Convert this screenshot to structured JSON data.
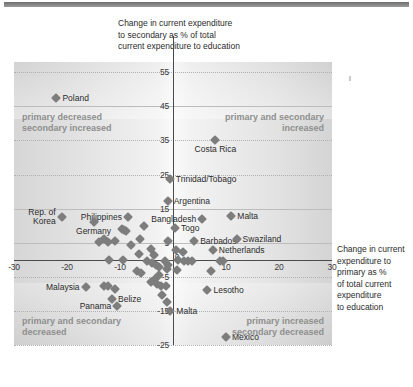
{
  "axis_titles": {
    "y": "Change in current expenditure\nto secondary as % of total\ncurrent expenditure to education",
    "x": "Change in current\nexpenditure to\nprimary as %\nof total current\nexpenditure\nto education"
  },
  "quadrants": {
    "top_left": "primary decreased\nsecondary increased",
    "top_right": "primary and secondary\nincreased",
    "bottom_left": "primary and secondary\ndecreased",
    "bottom_right": "primary increased\nsecondary decreased"
  },
  "chart_data": {
    "type": "scatter",
    "title": "",
    "xlabel": "Change in current expenditure to primary as % of total current expenditure to education",
    "ylabel": "Change in current expenditure to secondary as % of total current expenditure to education",
    "xlim": [
      -30,
      30
    ],
    "ylim": [
      -25,
      58
    ],
    "xticks": [
      -30,
      -20,
      -10,
      0,
      10,
      20,
      30
    ],
    "yticks": [
      55,
      45,
      35,
      25,
      15,
      5,
      -5,
      -15,
      -25
    ],
    "grid": true,
    "legend": "none",
    "marker": "diamond",
    "marker_color": "#7d7d7d",
    "points": [
      {
        "label": "Poland",
        "x": -22.0,
        "y": 47.5,
        "anchor": "right"
      },
      {
        "label": "Costa Rica",
        "x": 8.0,
        "y": 35.0,
        "anchor": "below"
      },
      {
        "label": "Trinidad/Tobago",
        "x": -0.6,
        "y": 23.8,
        "anchor": "right"
      },
      {
        "label": "Argentina",
        "x": -1.0,
        "y": 17.2,
        "anchor": "right"
      },
      {
        "label": "Rep. of\nKorea",
        "x": -21.0,
        "y": 12.6,
        "anchor": "left"
      },
      {
        "label": "Philippines",
        "x": -8.5,
        "y": 12.6,
        "anchor": "left"
      },
      {
        "label": "Bangladesh",
        "x": 5.5,
        "y": 12.0,
        "anchor": "left"
      },
      {
        "label": "Malta",
        "x": 11.0,
        "y": 12.8,
        "anchor": "right"
      },
      {
        "label": "Germany",
        "x": -15.0,
        "y": 11.0,
        "anchor": "below"
      },
      {
        "label": "Togo",
        "x": 0.4,
        "y": 9.2,
        "anchor": "right"
      },
      {
        "label": "Barbados",
        "x": 4.0,
        "y": 5.6,
        "anchor": "right"
      },
      {
        "label": "Swaziland",
        "x": 12.0,
        "y": 6.0,
        "anchor": "right"
      },
      {
        "label": "Netherlands",
        "x": 7.5,
        "y": 3.0,
        "anchor": "right"
      },
      {
        "label": "Malaysia",
        "x": -16.5,
        "y": -8.0,
        "anchor": "left"
      },
      {
        "label": "Belize",
        "x": -11.5,
        "y": -11.6,
        "anchor": "right"
      },
      {
        "label": "Panama",
        "x": -10.5,
        "y": -13.6,
        "anchor": "left"
      },
      {
        "label": "Malta",
        "x": -0.5,
        "y": -15.0,
        "anchor": "right"
      },
      {
        "label": "Lesotho",
        "x": 6.5,
        "y": -8.8,
        "anchor": "right"
      },
      {
        "label": "Mexico",
        "x": 10.0,
        "y": -22.6,
        "anchor": "right"
      },
      {
        "label": "",
        "x": -9.7,
        "y": 9.0
      },
      {
        "label": "",
        "x": -9.2,
        "y": 8.7
      },
      {
        "label": "",
        "x": -8.8,
        "y": 8.5
      },
      {
        "label": "",
        "x": -5.5,
        "y": 10.0
      },
      {
        "label": "",
        "x": -6.3,
        "y": 6.0
      },
      {
        "label": "",
        "x": -8.0,
        "y": 4.2
      },
      {
        "label": "",
        "x": -4.2,
        "y": 3.2
      },
      {
        "label": "",
        "x": -6.5,
        "y": 1.8
      },
      {
        "label": "",
        "x": -3.6,
        "y": 1.5
      },
      {
        "label": "",
        "x": -12.0,
        "y": 0.0
      },
      {
        "label": "",
        "x": -9.5,
        "y": 0.0
      },
      {
        "label": "",
        "x": -5.0,
        "y": -0.4
      },
      {
        "label": "",
        "x": -4.0,
        "y": -1.0
      },
      {
        "label": "",
        "x": -3.2,
        "y": -1.6
      },
      {
        "label": "",
        "x": -2.6,
        "y": -2.2
      },
      {
        "label": "",
        "x": -1.6,
        "y": -0.4
      },
      {
        "label": "",
        "x": -1.0,
        "y": -1.4
      },
      {
        "label": "",
        "x": -1.2,
        "y": -2.6
      },
      {
        "label": "",
        "x": -6.8,
        "y": -3.4
      },
      {
        "label": "",
        "x": -6.0,
        "y": -4.0
      },
      {
        "label": "",
        "x": -2.6,
        "y": -4.6
      },
      {
        "label": "",
        "x": -3.4,
        "y": -5.6
      },
      {
        "label": "",
        "x": -4.2,
        "y": -6.6
      },
      {
        "label": "",
        "x": -3.0,
        "y": -7.2
      },
      {
        "label": "",
        "x": -2.2,
        "y": -7.6
      },
      {
        "label": "",
        "x": -1.4,
        "y": -7.8
      },
      {
        "label": "",
        "x": -13.0,
        "y": -7.6
      },
      {
        "label": "",
        "x": -12.2,
        "y": -7.8
      },
      {
        "label": "",
        "x": -11.0,
        "y": -8.6
      },
      {
        "label": "",
        "x": -2.0,
        "y": -10.4
      },
      {
        "label": "",
        "x": -1.2,
        "y": -12.4
      },
      {
        "label": "",
        "x": 0.6,
        "y": 3.0
      },
      {
        "label": "",
        "x": 1.8,
        "y": 2.2
      },
      {
        "label": "",
        "x": 1.0,
        "y": -0.2
      },
      {
        "label": "",
        "x": 2.0,
        "y": -0.3
      },
      {
        "label": "",
        "x": 2.8,
        "y": -0.3
      },
      {
        "label": "",
        "x": 3.6,
        "y": -0.3
      },
      {
        "label": "",
        "x": 0.8,
        "y": -3.0
      },
      {
        "label": "",
        "x": 8.8,
        "y": -0.4
      },
      {
        "label": "",
        "x": 9.4,
        "y": -0.5
      },
      {
        "label": "",
        "x": 7.2,
        "y": -3.4
      },
      {
        "label": "",
        "x": -1.0,
        "y": 5.6
      },
      {
        "label": "",
        "x": -11.0,
        "y": 5.4
      },
      {
        "label": "",
        "x": -12.2,
        "y": 5.2
      },
      {
        "label": "",
        "x": -13.0,
        "y": 6.0
      },
      {
        "label": "",
        "x": -14.0,
        "y": 5.2
      }
    ]
  }
}
